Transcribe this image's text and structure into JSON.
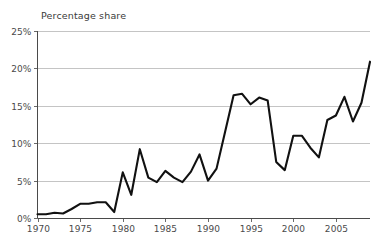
{
  "chart_data": {
    "type": "line",
    "title": "Percentage share",
    "subtitle": "",
    "xlabel": "",
    "ylabel": "Percentage share",
    "grid": true,
    "legend": false,
    "legend_position": "none",
    "xlim": [
      1970,
      2009
    ],
    "ylim": [
      0,
      25
    ],
    "y_tick_labels": [
      "0%",
      "5%",
      "10%",
      "15%",
      "20%",
      "25%"
    ],
    "y_tick_values": [
      0,
      5,
      10,
      15,
      20,
      25
    ],
    "x_tick_labels": [
      "1970",
      "1975",
      "1980",
      "1985",
      "1990",
      "1995",
      "2000",
      "2005"
    ],
    "x_tick_values": [
      1970,
      1975,
      1980,
      1985,
      1990,
      1995,
      2000,
      2005
    ],
    "line_color": "#111111",
    "grid_color": "#b5b5b5",
    "axis_color": "#4a4a4a",
    "x": [
      1970,
      1971,
      1972,
      1973,
      1974,
      1975,
      1976,
      1977,
      1978,
      1979,
      1980,
      1981,
      1982,
      1983,
      1984,
      1985,
      1986,
      1987,
      1988,
      1989,
      1990,
      1991,
      1992,
      1993,
      1994,
      1995,
      1996,
      1997,
      1998,
      1999,
      2000,
      2001,
      2002,
      2003,
      2004,
      2005,
      2006,
      2007,
      2008,
      2009
    ],
    "values": [
      0.5,
      0.5,
      0.7,
      0.6,
      1.2,
      1.9,
      1.9,
      2.1,
      2.1,
      0.8,
      6.1,
      3.1,
      9.2,
      5.4,
      4.8,
      6.3,
      5.4,
      4.8,
      6.2,
      8.5,
      5.0,
      6.6,
      11.5,
      16.4,
      16.6,
      15.2,
      16.1,
      15.7,
      7.5,
      6.4,
      11.0,
      11.0,
      9.4,
      8.1,
      13.1,
      13.7,
      16.2,
      12.9,
      15.4,
      20.9
    ],
    "series": [
      {
        "name": "Percentage share",
        "values": [
          0.5,
          0.5,
          0.7,
          0.6,
          1.2,
          1.9,
          1.9,
          2.1,
          2.1,
          0.8,
          6.1,
          3.1,
          9.2,
          5.4,
          4.8,
          6.3,
          5.4,
          4.8,
          6.2,
          8.5,
          5.0,
          6.6,
          11.5,
          16.4,
          16.6,
          15.2,
          16.1,
          15.7,
          7.5,
          6.4,
          11.0,
          11.0,
          9.4,
          8.1,
          13.1,
          13.7,
          16.2,
          12.9,
          15.4,
          20.9
        ]
      }
    ]
  }
}
